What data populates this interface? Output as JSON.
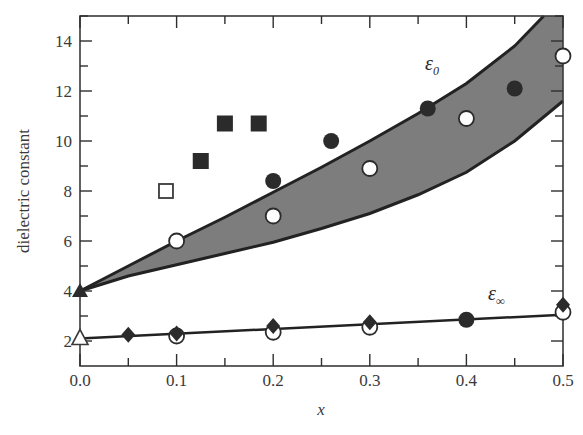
{
  "chart_data": {
    "type": "scatter",
    "title": "",
    "xlabel": "x",
    "ylabel": "dielectric constant",
    "xlim": [
      0.0,
      0.5
    ],
    "ylim": [
      1.0,
      15.0
    ],
    "x_ticks": [
      "0.0",
      "0.1",
      "0.2",
      "0.3",
      "0.4",
      "0.5"
    ],
    "y_ticks": [
      "2",
      "4",
      "6",
      "8",
      "10",
      "12",
      "14"
    ],
    "grid": false,
    "annotations": [
      {
        "text": "ε0",
        "label": "epsilon_0",
        "x": 0.41,
        "y": 14.0
      },
      {
        "text": "ε∞",
        "label": "epsilon_infinity",
        "x": 0.41,
        "y": 3.7
      }
    ],
    "bands": [
      {
        "name": "epsilon_0 band",
        "fill": "#7d7d7d",
        "x": [
          0.0,
          0.05,
          0.1,
          0.15,
          0.2,
          0.25,
          0.3,
          0.35,
          0.4,
          0.45,
          0.48
        ],
        "upper": [
          4.0,
          5.0,
          6.0,
          6.95,
          7.95,
          8.95,
          10.0,
          11.1,
          12.3,
          13.8,
          15.0
        ],
        "x_lower": [
          0.0,
          0.05,
          0.1,
          0.15,
          0.2,
          0.25,
          0.3,
          0.35,
          0.4,
          0.45,
          0.5
        ],
        "lower": [
          4.0,
          4.6,
          5.05,
          5.5,
          5.95,
          6.5,
          7.1,
          7.85,
          8.75,
          10.0,
          11.6
        ]
      }
    ],
    "series": [
      {
        "name": "epsilon_0 open squares",
        "marker": "square-open",
        "x": [
          0.089
        ],
        "y": [
          8.0
        ]
      },
      {
        "name": "epsilon_0 filled squares",
        "marker": "square-filled",
        "x": [
          0.125,
          0.15,
          0.185
        ],
        "y": [
          9.2,
          10.7,
          10.7
        ]
      },
      {
        "name": "epsilon_0 filled circles",
        "marker": "circle-filled",
        "x": [
          0.2,
          0.26,
          0.36,
          0.45
        ],
        "y": [
          8.4,
          10.0,
          11.3,
          12.1
        ]
      },
      {
        "name": "epsilon_0 open circles",
        "marker": "circle-open",
        "x": [
          0.1,
          0.2,
          0.3,
          0.4,
          0.5
        ],
        "y": [
          6.0,
          7.0,
          8.9,
          10.9,
          13.4
        ]
      },
      {
        "name": "epsilon_0 filled triangle",
        "marker": "triangle-filled",
        "x": [
          0.0
        ],
        "y": [
          4.0
        ]
      },
      {
        "name": "epsilon_inf open triangle",
        "marker": "triangle-open",
        "x": [
          0.0
        ],
        "y": [
          2.1
        ]
      },
      {
        "name": "epsilon_inf filled diamonds",
        "marker": "diamond-filled",
        "x": [
          0.05,
          0.1,
          0.2,
          0.3,
          0.5
        ],
        "y": [
          2.25,
          2.3,
          2.6,
          2.75,
          3.45
        ]
      },
      {
        "name": "epsilon_inf filled circle",
        "marker": "circle-filled",
        "x": [
          0.4
        ],
        "y": [
          2.85
        ]
      },
      {
        "name": "epsilon_inf open circles",
        "marker": "circle-open",
        "x": [
          0.1,
          0.2,
          0.3,
          0.5
        ],
        "y": [
          2.2,
          2.35,
          2.55,
          3.15
        ]
      },
      {
        "name": "epsilon_inf line",
        "marker": "line",
        "x": [
          0.0,
          0.5
        ],
        "y": [
          2.1,
          3.05
        ]
      }
    ]
  }
}
